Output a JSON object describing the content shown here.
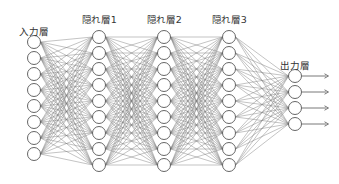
{
  "diagram": {
    "type": "neural-network",
    "colors": {
      "edge": "#7a7a7a",
      "node_stroke": "#555555",
      "node_fill": "#ffffff",
      "text": "#333333"
    },
    "layers": [
      {
        "id": "input",
        "label": "入力層",
        "nodes": 8,
        "x": 34,
        "y_start": 42,
        "step": 16,
        "label_y": 24
      },
      {
        "id": "hidden1",
        "label": "隠れ層1",
        "nodes": 9,
        "x": 99,
        "y_start": 37,
        "step": 16,
        "label_y": 12
      },
      {
        "id": "hidden2",
        "label": "隠れ層2",
        "nodes": 9,
        "x": 164,
        "y_start": 37,
        "step": 16,
        "label_y": 12
      },
      {
        "id": "hidden3",
        "label": "隠れ層3",
        "nodes": 9,
        "x": 229,
        "y_start": 37,
        "step": 16,
        "label_y": 12
      },
      {
        "id": "output",
        "label": "出力層",
        "nodes": 4,
        "x": 295,
        "y_start": 76,
        "step": 16,
        "label_y": 58
      }
    ],
    "node_radius": 6.5,
    "output_arrows": {
      "length": 27
    }
  }
}
